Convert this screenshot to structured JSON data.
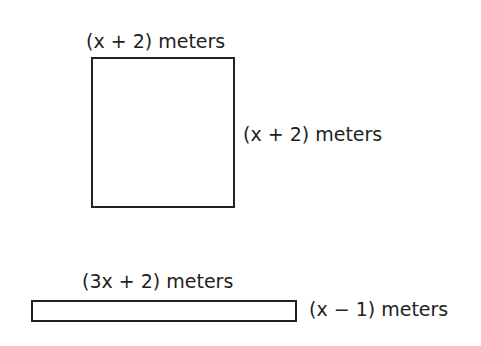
{
  "square": {
    "top_label": "(x + 2) meters",
    "side_label": "(x + 2) meters"
  },
  "rectangle": {
    "top_label": "(3x + 2) meters",
    "side_label": "(x − 1) meters"
  }
}
